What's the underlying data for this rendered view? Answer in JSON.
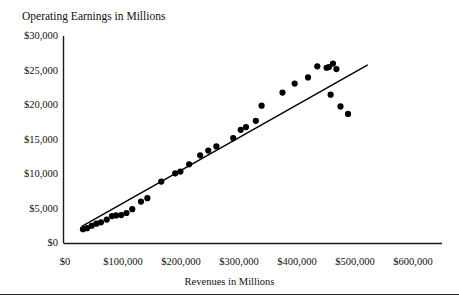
{
  "chart_data": {
    "type": "scatter",
    "title": "Operating Earnings in Millions",
    "xlabel": "Revenues in Millions",
    "ylabel": "",
    "xlim": [
      0,
      600000
    ],
    "ylim": [
      0,
      30000
    ],
    "grid": false,
    "legend": null,
    "x_ticks": [
      0,
      100000,
      200000,
      300000,
      400000,
      500000,
      600000
    ],
    "y_ticks": [
      0,
      5000,
      10000,
      15000,
      20000,
      25000,
      30000
    ],
    "x_tick_labels": [
      "$0",
      "$100,000",
      "$200,000",
      "$300,000",
      "$400,000",
      "$500,000",
      "$600,000"
    ],
    "y_tick_labels": [
      "$0",
      "$5,000",
      "$10,000",
      "$15,000",
      "$20,000",
      "$25,000",
      "$30,000"
    ],
    "series": [
      {
        "name": "Companies",
        "marker": "filled-circle",
        "color": "#000000",
        "points": [
          [
            31000,
            2000
          ],
          [
            38000,
            2150
          ],
          [
            46000,
            2500
          ],
          [
            54000,
            2800
          ],
          [
            62000,
            3000
          ],
          [
            72000,
            3400
          ],
          [
            81000,
            3900
          ],
          [
            88000,
            4000
          ],
          [
            97000,
            4050
          ],
          [
            106000,
            4350
          ],
          [
            116000,
            4900
          ],
          [
            131000,
            6000
          ],
          [
            142000,
            6500
          ],
          [
            166000,
            8900
          ],
          [
            190000,
            10100
          ],
          [
            199000,
            10350
          ],
          [
            214000,
            11400
          ],
          [
            233000,
            12700
          ],
          [
            247000,
            13400
          ],
          [
            261000,
            14000
          ],
          [
            290000,
            15200
          ],
          [
            303000,
            16400
          ],
          [
            312000,
            16800
          ],
          [
            329000,
            17700
          ],
          [
            339000,
            19900
          ],
          [
            375000,
            21800
          ],
          [
            396000,
            23100
          ],
          [
            419000,
            24000
          ],
          [
            435000,
            25600
          ],
          [
            451000,
            25400
          ],
          [
            455000,
            25500
          ],
          [
            462000,
            26000
          ],
          [
            468000,
            25200
          ],
          [
            458000,
            21500
          ],
          [
            475000,
            19800
          ],
          [
            488000,
            18700
          ]
        ]
      }
    ],
    "trendline": {
      "name": "Linear trend",
      "color": "#000000",
      "x_start": 29000,
      "y_start": 2400,
      "x_end": 522000,
      "y_end": 25800
    }
  }
}
